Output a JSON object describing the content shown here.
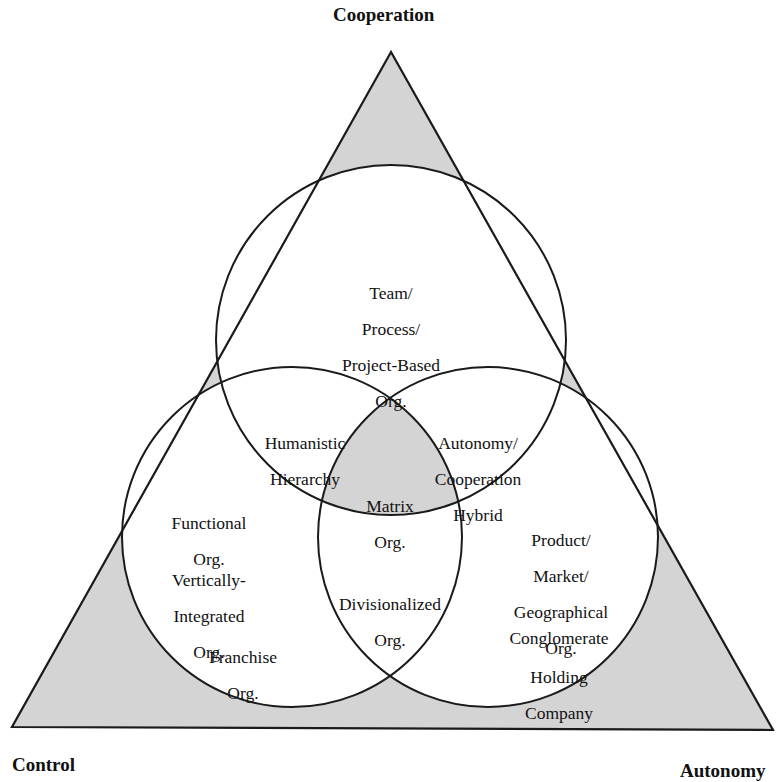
{
  "diagram": {
    "type": "triangle-venn",
    "vertices": {
      "top": "Cooperation",
      "bottom_left": "Control",
      "bottom_right": "Autonomy"
    },
    "colors": {
      "shade": "#d4d4d4",
      "line": "#1a1a1a",
      "background": "#ffffff"
    },
    "regions": {
      "top_only": [
        "Team/",
        "Process/",
        "Project-Based",
        "Org."
      ],
      "top_left": [
        "Humanistic",
        "Hierarchy"
      ],
      "top_right": [
        "Autonomy/",
        "Cooperation",
        "Hybrid"
      ],
      "center": [
        "Matrix",
        "Org."
      ],
      "left_right": [
        "Divisionalized",
        "Org."
      ],
      "left_only": {
        "functional": [
          "Functional",
          "Org."
        ],
        "vertical": [
          "Vertically-",
          "Integrated",
          "Org."
        ],
        "franchise": [
          "Franchise",
          "Org."
        ]
      },
      "right_only": {
        "product": [
          "Product/",
          "Market/",
          "Geographical",
          "Org."
        ],
        "conglomerate": [
          "Conglomerate"
        ],
        "holding": [
          "Holding",
          "Company"
        ]
      }
    }
  }
}
